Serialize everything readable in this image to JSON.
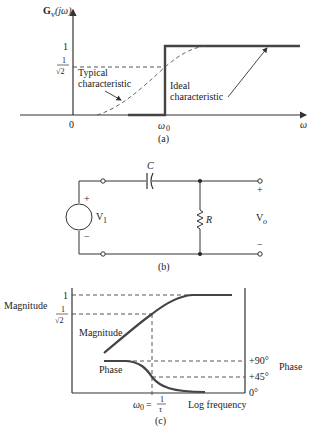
{
  "figure": {
    "panel_a": {
      "caption": "(a)",
      "y_axis_label_main": "G",
      "y_axis_label_sub": "v",
      "y_axis_label_arg": "(jω)",
      "x_axis_label": "ω",
      "origin_label": "0",
      "omega0_label_main": "ω",
      "omega0_label_sub": "0",
      "level_one": "1",
      "level_half_num": "1",
      "level_half_den": "√2",
      "typical_line1": "Typical",
      "typical_line2": "characteristic",
      "ideal_line1": "Ideal",
      "ideal_line2": "characteristic"
    },
    "panel_b": {
      "caption": "(b)",
      "capacitor_label": "C",
      "resistor_label": "R",
      "source_label_main": "V",
      "source_label_sub": "1",
      "output_label_main": "V",
      "output_label_sub": "o",
      "plus_in": "+",
      "minus_in": "−",
      "plus_out": "+",
      "minus_out": "−"
    },
    "panel_c": {
      "caption": "(c)",
      "left_axis_title": "Magnitude",
      "right_axis_title": "Phase",
      "level_one": "1",
      "level_half_num": "1",
      "level_half_den": "√2",
      "magnitude_curve_label": "Magnitude",
      "phase_curve_label": "Phase",
      "phase_90": "+90°",
      "phase_45": "+45°",
      "phase_0": "0°",
      "omega0_main": "ω",
      "omega0_sub": "0",
      "omega0_eq": "=",
      "tau_num": "1",
      "tau_den": "τ",
      "x_axis_title": "Log frequency"
    }
  }
}
